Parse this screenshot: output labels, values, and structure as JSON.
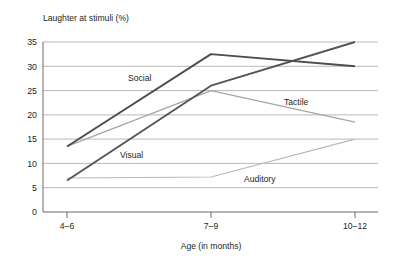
{
  "chart_data": {
    "type": "line",
    "title": "",
    "ylabel": "Laughter at stimuli (%)",
    "xlabel": "Age (in months)",
    "categories": [
      "4–6",
      "7–9",
      "10–12"
    ],
    "yticks": [
      "0",
      "5",
      "10",
      "15",
      "20",
      "25",
      "30",
      "35"
    ],
    "ylim": [
      0,
      35
    ],
    "grid": true,
    "legend_position": "inline-labels",
    "series": [
      {
        "name": "Social",
        "values": [
          13.5,
          32.5,
          30.0
        ],
        "color": "#4d4d4d",
        "width": 1.9
      },
      {
        "name": "Visual",
        "values": [
          6.5,
          26.0,
          35.0
        ],
        "color": "#555555",
        "width": 1.9
      },
      {
        "name": "Tactile",
        "values": [
          13.5,
          25.0,
          18.5
        ],
        "color": "#a6a6a6",
        "width": 1.2
      },
      {
        "name": "Auditory",
        "values": [
          7.0,
          7.2,
          15.0
        ],
        "color": "#b8b8b8",
        "width": 1.1
      }
    ]
  },
  "labels": {
    "ytitle": "Laughter at stimuli (%)",
    "xtitle": "Age (in months)",
    "social": "Social",
    "visual": "Visual",
    "tactile": "Tactile",
    "auditory": "Auditory",
    "xtick0": "4–6",
    "xtick1": "7–9",
    "xtick2": "10–12",
    "y0": "0",
    "y5": "5",
    "y10": "10",
    "y15": "15",
    "y20": "20",
    "y25": "25",
    "y30": "30",
    "y35": "35"
  },
  "colors": {
    "social": "#4d4d4d",
    "visual": "#555555",
    "tactile": "#a6a6a6",
    "auditory": "#b8b8b8",
    "grid": "#9b9b9b",
    "axis": "#5a5a5a",
    "background": "#ffffff"
  }
}
